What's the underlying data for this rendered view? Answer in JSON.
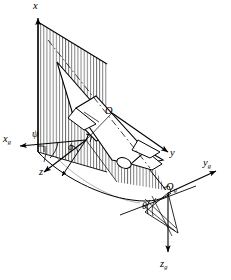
{
  "figure": {
    "type": "technical-line-diagram",
    "background_color": "#ffffff",
    "line_color": "#000000",
    "hatch_color": "#3a3a3a"
  },
  "axes": {
    "body": [
      {
        "id": "x",
        "label": "x",
        "subscript": "",
        "direction": "up",
        "tip": [
          38,
          14
        ]
      },
      {
        "id": "y",
        "label": "y",
        "subscript": "",
        "direction": "lower-right",
        "tip": [
          170,
          155
        ]
      },
      {
        "id": "z",
        "label": "z",
        "subscript": "",
        "direction": "lower-left",
        "tip": [
          46,
          172
        ]
      }
    ],
    "ground": [
      {
        "id": "xg",
        "label": "x",
        "subscript": "g",
        "direction": "left",
        "tip": [
          16,
          148
        ]
      },
      {
        "id": "yg",
        "label": "y",
        "subscript": "g",
        "direction": "right",
        "tip": [
          214,
          180
        ]
      },
      {
        "id": "zg",
        "label": "z",
        "subscript": "g",
        "direction": "down",
        "tip": [
          165,
          258
        ]
      }
    ]
  },
  "origins": [
    {
      "id": "O",
      "label": "O",
      "subscript": "",
      "note": "body-axis origin at aircraft centre of mass",
      "x": 112,
      "y": 113
    },
    {
      "id": "Og",
      "label": "O",
      "subscript": "g",
      "note": "ground-axis origin",
      "x": 168,
      "y": 193
    }
  ],
  "angles": [
    {
      "id": "psi",
      "symbol": "ψ",
      "name": "yaw",
      "x": 36,
      "y": 135
    },
    {
      "id": "phi",
      "symbol": "ϕ",
      "name": "roll",
      "x": 73,
      "y": 148
    },
    {
      "id": "theta",
      "symbol": "θ",
      "name": "pitch",
      "x": 148,
      "y": 205
    }
  ],
  "labels": {
    "x": "x",
    "y": "y",
    "z": "z",
    "x_sub": "g",
    "y_sub": "g",
    "z_sub": "g",
    "origin": "O",
    "origin_sub": "g",
    "psi": "ψ",
    "phi": "ϕ",
    "theta": "θ"
  },
  "elements": {
    "aircraft": "delta-wing jet aircraft shown in three-quarter view",
    "plane_vertical_left": "hatched vertical plane containing the x axis",
    "plane_vertical_right": "hatched vertical plane through the aircraft body",
    "ground_plane": "curved ground reference surface",
    "right_angle_marks": 3
  }
}
